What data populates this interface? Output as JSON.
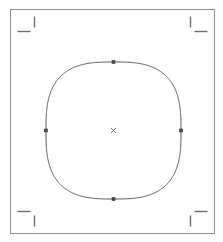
{
  "document": {
    "title": "Superellipse path canvas",
    "background_color": "#ffffff",
    "width": 223,
    "height": 242
  },
  "page_border": {
    "name": "page boundary",
    "x": 10,
    "y": 9,
    "width": 204,
    "height": 224,
    "stroke_color": "#8f8f8f",
    "stroke_width": 1,
    "fill": "none"
  },
  "crop_marks": {
    "stroke_color": "#6e6e6e",
    "stroke_width": 1.4,
    "length": 13,
    "items": [
      {
        "id": "top-left",
        "label": "Top left crop mark",
        "horizontal": {
          "x1": 17,
          "y1": 31,
          "x2": 30,
          "y2": 31
        },
        "vertical": {
          "x1": 34,
          "y1": 16,
          "x2": 34,
          "y2": 27
        }
      },
      {
        "id": "top-right",
        "label": "Top right crop mark",
        "horizontal": {
          "x1": 194,
          "y1": 31,
          "x2": 207,
          "y2": 31
        },
        "vertical": {
          "x1": 190,
          "y1": 16,
          "x2": 190,
          "y2": 27
        }
      },
      {
        "id": "bottom-left",
        "label": "Bottom left crop mark",
        "horizontal": {
          "x1": 17,
          "y1": 211,
          "x2": 30,
          "y2": 211
        },
        "vertical": {
          "x1": 34,
          "y1": 215,
          "x2": 34,
          "y2": 226
        }
      },
      {
        "id": "bottom-right",
        "label": "Bottom right crop mark",
        "horizontal": {
          "x1": 194,
          "y1": 211,
          "x2": 207,
          "y2": 211
        },
        "vertical": {
          "x1": 190,
          "y1": 215,
          "x2": 190,
          "y2": 226
        }
      }
    ]
  },
  "shape": {
    "name": "squircle path",
    "type": "superellipse",
    "center_x": 113.5,
    "center_y": 130.5,
    "radius_x": 67.5,
    "radius_y": 68.5,
    "exponent": 2.9,
    "stroke_color": "#585858",
    "stroke_width": 1,
    "fill": "none",
    "bounds": {
      "left": 46,
      "top": 62,
      "right": 181,
      "bottom": 199
    }
  },
  "nodes": {
    "stroke_color": "#3a3a3a",
    "fill_color": "#4a4a4a",
    "size": 3,
    "items": [
      {
        "id": "node-top",
        "label": "Top anchor node",
        "x": 113.5,
        "y": 62.0
      },
      {
        "id": "node-right",
        "label": "Right anchor node",
        "x": 181.0,
        "y": 130.5
      },
      {
        "id": "node-bottom",
        "label": "Bottom anchor node",
        "x": 113.5,
        "y": 199.0
      },
      {
        "id": "node-left",
        "label": "Left anchor node",
        "x": 46.0,
        "y": 130.5
      }
    ]
  },
  "center_marker": {
    "id": "center-marker",
    "label": "Object center marker",
    "x": 113.5,
    "y": 130.5,
    "size": 2.6,
    "stroke_color": "#6a6a6a",
    "stroke_width": 0.9
  }
}
